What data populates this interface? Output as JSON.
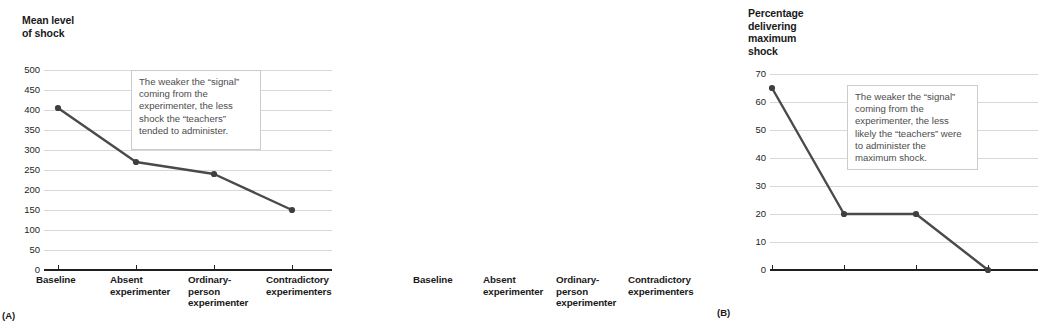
{
  "figure": {
    "panels": [
      {
        "letter": "(A)",
        "axis_title": "Mean level\nof shock",
        "callout": "The weaker the “signal” coming from the experimenter, the less shock the “teachers” tended to administer."
      },
      {
        "letter": "(B)",
        "axis_title": "Percentage\ndelivering\nmaximum\nshock",
        "callout": "The weaker the “signal” coming from the experimenter, the less likely the “teachers” were to administer the maximum shock."
      }
    ]
  },
  "colors": {
    "line": "#4a4a4a",
    "marker": "#3f3f3f",
    "gridline": "#d8d8d8",
    "axis": "#231f20",
    "callout_border": "#c9ccd1",
    "text": "#1a1a1a",
    "callout_text": "#4d4d4d"
  },
  "categories": [
    "Baseline",
    "Absent\nexperimenter",
    "Ordinary-\nperson\nexperimenter",
    "Contradictory\nexperimenters"
  ],
  "chart_data": [
    {
      "type": "line",
      "title": "Mean level of shock",
      "panel": "(A)",
      "xlabel": "",
      "ylabel": "Mean level of shock",
      "categories": [
        "Baseline",
        "Absent experimenter",
        "Ordinary-person experimenter",
        "Contradictory experimenters"
      ],
      "values": [
        405,
        270,
        240,
        150
      ],
      "ylim": [
        0,
        500
      ],
      "yticks": [
        0,
        50,
        100,
        150,
        200,
        250,
        300,
        350,
        400,
        450,
        500
      ],
      "ytick_labels": [
        "0",
        "50",
        "100",
        "150",
        "200",
        "250",
        "300",
        "350",
        "400",
        "450",
        "500"
      ],
      "grid": true,
      "legend": "none",
      "annotation": "The weaker the “signal” coming from the experimenter, the less shock the “teachers” tended to administer."
    },
    {
      "type": "line",
      "title": "Percentage delivering maximum shock",
      "panel": "(B)",
      "xlabel": "",
      "ylabel": "Percentage delivering maximum shock",
      "categories": [
        "Baseline",
        "Absent experimenter",
        "Ordinary-person experimenter",
        "Contradictory experimenters"
      ],
      "values": [
        65,
        20,
        20,
        0
      ],
      "ylim": [
        0,
        70
      ],
      "yticks": [
        0,
        10,
        20,
        30,
        40,
        50,
        60,
        70
      ],
      "ytick_labels": [
        "0",
        "10",
        "20",
        "30",
        "40",
        "50",
        "60",
        "70"
      ],
      "grid": true,
      "legend": "none",
      "annotation": "The weaker the “signal” coming from the experimenter, the less likely the “teachers” were to administer the maximum shock."
    }
  ]
}
